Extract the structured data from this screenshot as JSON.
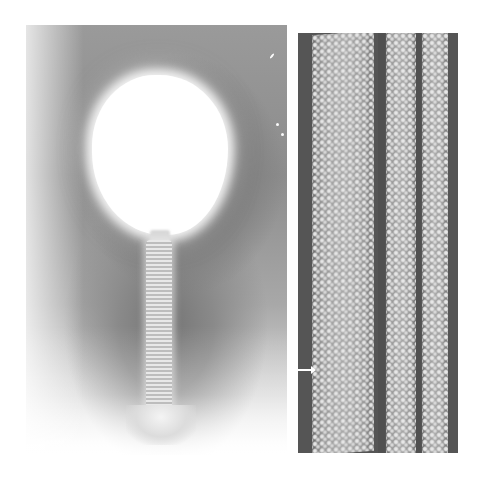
{
  "figure": {
    "panels": [
      {
        "id": "left",
        "description": "Electron micrograph of a bacteriophage particle: white polyhedral head with a striated tail and baseplate on a gray stained background"
      },
      {
        "id": "right",
        "description": "Electron micrograph of helical tail-tube lattice with periodic subunits",
        "annotations": [
          {
            "type": "arrow",
            "direction": "right",
            "color": "#ffffff"
          }
        ]
      }
    ],
    "colors": {
      "background": "#ffffff",
      "left_stain": "#7e7e7e",
      "right_background": "#555555",
      "subunit_highlight": "#f2f2f2"
    }
  }
}
